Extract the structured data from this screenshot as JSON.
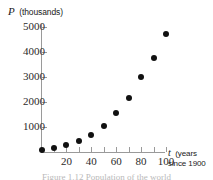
{
  "chart_data": {
    "type": "scatter",
    "title": "",
    "ylabel_var": "P",
    "ylabel_unit": "(thousands)",
    "xlabel_var": "t",
    "xlabel_unit": "(years",
    "xlabel_unit2": "since 1900",
    "xlabel_full": "t (years since 1900)",
    "ylabel_full": "P (thousands)",
    "x": [
      0,
      10,
      20,
      30,
      40,
      50,
      60,
      70,
      80,
      90,
      100
    ],
    "values": [
      100,
      180,
      280,
      450,
      700,
      1050,
      1550,
      2150,
      3000,
      3750,
      4700
    ],
    "xticks": [
      20,
      40,
      60,
      80,
      100
    ],
    "xtick_labels": [
      "20",
      "40",
      "60",
      "80",
      "100"
    ],
    "yticks": [
      1000,
      2000,
      3000,
      4000,
      5000
    ],
    "ytick_labels": [
      "1000",
      "2000",
      "3000",
      "4000",
      "5000"
    ],
    "xlim": [
      0,
      110
    ],
    "ylim": [
      0,
      5200
    ],
    "grid": false,
    "legend": false,
    "marker": "filled-circle",
    "marker_color": "#111111",
    "axis_color": "#9a9a9a"
  },
  "caption": {
    "text": "Figure 1.12  Population of the world"
  }
}
